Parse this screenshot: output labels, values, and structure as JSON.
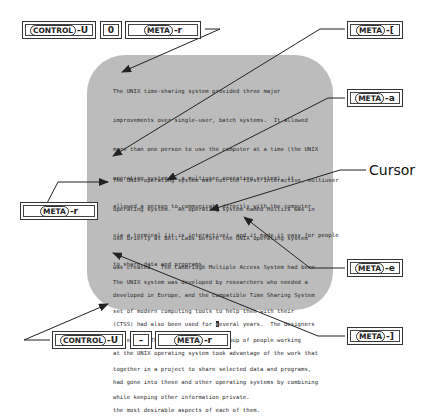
{
  "paragraphs": [
    {
      "lines": [
        "The UNIX time-sharing system provided three major",
        "improvements over single-user, batch systems.  It allowed",
        "more than one person to use the computer at a time (the UNIX",
        "operating system is a multiuser operating system), it",
        "allowed a person to communicate directly with the computer",
        "via a terminal (it is interactive), and it made it easy for people",
        "to share data and programs."
      ]
    },
    {
      "lines": [
        "The UNIX operating system was not the first interactive, multiuser",
        "operating system.  An operating system named Multics was in",
        "use briefly at Bell Labs before the UNIX operating system",
        "was created.  The Cambridge Multiple Access System had been",
        "developed in Europe, and the Compatible Time Sharing System",
        "(CTSS) had also been used for several years.  The designers",
        "at the UNIX operating system took advantage of the work that",
        "had gone into these and other operating systems by combining",
        "the most desirable aspects of each of them."
      ]
    },
    {
      "lines": [
        "The UNIX system was developed by researchers who needed a",
        "set of modern computing tools to help them with their",
        "projects.  The system allowed a group of people working",
        "together in a project to share selected data and programs,",
        "while keeping other information private."
      ]
    }
  ],
  "cursor": {
    "label": "Cursor",
    "line_before": "(CTSS) had also been used for ",
    "char": "s",
    "line_after": "everal years.  The designers"
  },
  "keys": {
    "top_left": [
      {
        "cap": "CONTROL",
        "suffix": "-U"
      },
      {
        "cap": "",
        "suffix": "0"
      },
      {
        "cap": "META",
        "suffix": "-r"
      }
    ],
    "meta_bracket_open": {
      "cap": "META",
      "suffix": "-["
    },
    "meta_a": {
      "cap": "META",
      "suffix": "-a"
    },
    "meta_r_left": {
      "cap": "META",
      "suffix": "-r"
    },
    "meta_e": {
      "cap": "META",
      "suffix": "-e"
    },
    "meta_bracket_close": {
      "cap": "META",
      "suffix": "-]"
    },
    "bottom_left": [
      {
        "cap": "CONTROL",
        "suffix": "-U"
      },
      {
        "cap": "",
        "suffix": "–"
      },
      {
        "cap": "META",
        "suffix": "-r"
      }
    ]
  },
  "colors": {
    "screen_bg": "#bcbcbc",
    "text": "#2a2a2a",
    "line": "#222222"
  }
}
